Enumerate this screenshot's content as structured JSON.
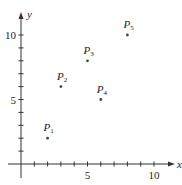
{
  "chart_data": {
    "type": "scatter",
    "title": "",
    "xlabel": "x",
    "ylabel": "y",
    "xlim": [
      0,
      11
    ],
    "ylim": [
      0,
      11
    ],
    "grid": false,
    "legend": null,
    "x_ticks": [
      1,
      2,
      3,
      4,
      5,
      6,
      7,
      8,
      9,
      10
    ],
    "y_ticks": [
      1,
      2,
      3,
      4,
      5,
      6,
      7,
      8,
      9,
      10
    ],
    "x_tick_labels": [
      {
        "value": 5,
        "label": "5"
      },
      {
        "value": 10,
        "label": "10"
      }
    ],
    "y_tick_labels": [
      {
        "value": 5,
        "label": "5"
      },
      {
        "value": 10,
        "label": "10"
      }
    ],
    "points": [
      {
        "name": "P",
        "sub": "1",
        "x": 2,
        "y": 2
      },
      {
        "name": "P",
        "sub": "2",
        "x": 3,
        "y": 6
      },
      {
        "name": "P",
        "sub": "3",
        "x": 5,
        "y": 8
      },
      {
        "name": "P",
        "sub": "4",
        "x": 6,
        "y": 5
      },
      {
        "name": "P",
        "sub": "5",
        "x": 8,
        "y": 10
      }
    ],
    "colors": {
      "axis": "#333333",
      "point": "#444444",
      "text": "#222222"
    }
  }
}
